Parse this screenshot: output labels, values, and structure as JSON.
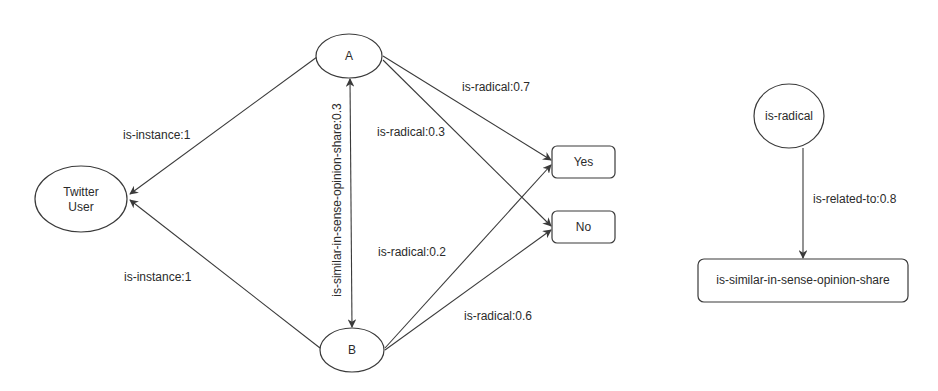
{
  "diagram": {
    "background": "#ffffff",
    "stroke_color": "#3a3a3a",
    "nodes": {
      "a": {
        "label": "A",
        "shape": "ellipse"
      },
      "b": {
        "label": "B",
        "shape": "ellipse"
      },
      "twitter_user": {
        "label_line1": "Twitter",
        "label_line2": "User",
        "shape": "ellipse"
      },
      "yes": {
        "label": "Yes",
        "shape": "rounded-rect"
      },
      "no": {
        "label": "No",
        "shape": "rounded-rect"
      },
      "is_radical": {
        "label": "is-radical",
        "shape": "ellipse"
      },
      "similar": {
        "label": "is-similar-in-sense-opinion-share",
        "shape": "rounded-rect"
      }
    },
    "edges": [
      {
        "id": "a_to_twitter",
        "from": "A",
        "to": "Twitter User",
        "label": "is-instance:1"
      },
      {
        "id": "b_to_twitter",
        "from": "B",
        "to": "Twitter User",
        "label": "is-instance:1"
      },
      {
        "id": "a_b_similar",
        "from": "A",
        "to": "B",
        "label": "is-similar-in-sense-opinion-share:0.3",
        "bidirectional": true
      },
      {
        "id": "a_to_yes",
        "from": "A",
        "to": "Yes",
        "label": "is-radical:0.7"
      },
      {
        "id": "a_to_no",
        "from": "A",
        "to": "No",
        "label": "is-radical:0.3"
      },
      {
        "id": "b_to_yes",
        "from": "B",
        "to": "Yes",
        "label": "is-radical:0.2"
      },
      {
        "id": "b_to_no",
        "from": "B",
        "to": "No",
        "label": "is-radical:0.6"
      },
      {
        "id": "radical_to_similar",
        "from": "is-radical",
        "to": "is-similar-in-sense-opinion-share",
        "label": "is-related-to:0.8"
      }
    ]
  }
}
